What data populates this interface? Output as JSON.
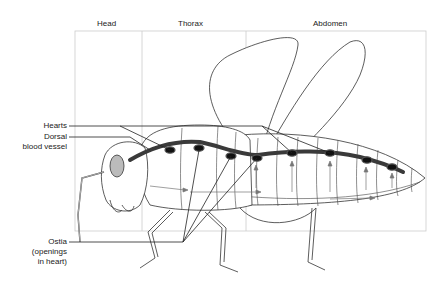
{
  "regions": [
    {
      "label": "Head"
    },
    {
      "label": "Thorax"
    },
    {
      "label": "Abdomen"
    }
  ],
  "callouts": {
    "hearts": "Hearts",
    "dorsal_line1": "Dorsal",
    "dorsal_line2": "blood vessel",
    "ostia_line1": "Ostia",
    "ostia_line2": "(openings",
    "ostia_line3": "in heart)"
  },
  "colors": {
    "outline": "#333333",
    "vessel": "#3a3a3a",
    "heart": "#111111",
    "eye_fill": "#bbbbbb",
    "box": "#cccccc",
    "arrow": "#777777"
  }
}
